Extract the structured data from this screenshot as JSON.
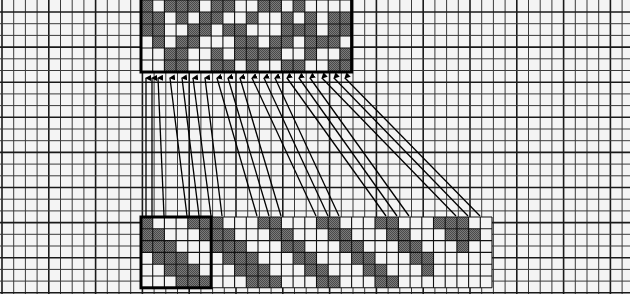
{
  "diagram": {
    "type": "weave-draft-mapping",
    "background": "#f4f4f4",
    "grid": {
      "cell": 11.7,
      "origin_x": 2,
      "origin_y": 0,
      "line_color": "#1a1a1a",
      "minor_line_color": "#3a3a3a",
      "major_every": 4
    },
    "colors": {
      "dark_cell": "#6f6f6f",
      "light_cell": "#f4f4f4",
      "frame": "#000000",
      "arrow": "#000000"
    },
    "top_box": {
      "label": "",
      "x": 141,
      "y": 0,
      "cols": 18,
      "rows": 6,
      "pattern": [
        "101110110011010000",
        "110101100100101011",
        "110011011000111011",
        "010110001101101110",
        "001100101111001001",
        "001100110100110011"
      ]
    },
    "bottom_strip": {
      "x": 141,
      "y": 217,
      "cols": 30,
      "rows": 6,
      "pattern": [
        "100011100011000110001100011100",
        "110001110001100011000110001110",
        "111000111000110001100011000100",
        "011100011100011000110001100000",
        "001110001110001100011000100000",
        "000111000111000110001100000000"
      ]
    },
    "bottom_box": {
      "x": 141,
      "y": 217,
      "cols": 6,
      "rows": 6
    },
    "arrows": [
      {
        "from_x": 146,
        "to_x": 146
      },
      {
        "from_x": 152,
        "to_x": 152
      },
      {
        "from_x": 158,
        "to_x": 164
      },
      {
        "from_x": 170,
        "to_x": 187
      },
      {
        "from_x": 182,
        "to_x": 199
      },
      {
        "from_x": 193,
        "to_x": 211
      },
      {
        "from_x": 205,
        "to_x": 222
      },
      {
        "from_x": 217,
        "to_x": 257
      },
      {
        "from_x": 228,
        "to_x": 269
      },
      {
        "from_x": 240,
        "to_x": 281
      },
      {
        "from_x": 252,
        "to_x": 316
      },
      {
        "from_x": 264,
        "to_x": 328
      },
      {
        "from_x": 275,
        "to_x": 339
      },
      {
        "from_x": 287,
        "to_x": 386
      },
      {
        "from_x": 299,
        "to_x": 397
      },
      {
        "from_x": 310,
        "to_x": 409
      },
      {
        "from_x": 322,
        "to_x": 456
      },
      {
        "from_x": 334,
        "to_x": 468
      },
      {
        "from_x": 345,
        "to_x": 480
      }
    ],
    "arrow_top_y": 74,
    "arrow_bottom_y": 216
  }
}
